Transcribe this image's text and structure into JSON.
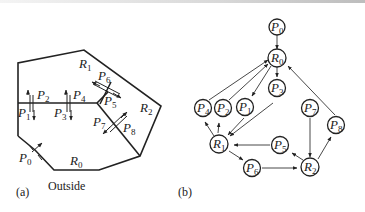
{
  "figure": {
    "panel_a": {
      "caption": "(a)",
      "outside_label": "Outside",
      "rooms": [
        {
          "id": "R0",
          "letter": "R",
          "sub": "0"
        },
        {
          "id": "R1",
          "letter": "R",
          "sub": "1"
        },
        {
          "id": "R2",
          "letter": "R",
          "sub": "2"
        }
      ],
      "doors": [
        {
          "id": "P0",
          "letter": "P",
          "sub": "0"
        },
        {
          "id": "P1",
          "letter": "P",
          "sub": "1"
        },
        {
          "id": "P2",
          "letter": "P",
          "sub": "2"
        },
        {
          "id": "P3",
          "letter": "P",
          "sub": "3"
        },
        {
          "id": "P4",
          "letter": "P",
          "sub": "4"
        },
        {
          "id": "P5",
          "letter": "P",
          "sub": "5"
        },
        {
          "id": "P6",
          "letter": "P",
          "sub": "6"
        },
        {
          "id": "P7",
          "letter": "P",
          "sub": "7"
        },
        {
          "id": "P8",
          "letter": "P",
          "sub": "8"
        }
      ]
    },
    "panel_b": {
      "caption": "(b)",
      "nodes": [
        {
          "id": "P0",
          "letter": "P",
          "sub": "0"
        },
        {
          "id": "R0",
          "letter": "R",
          "sub": "0"
        },
        {
          "id": "P3",
          "letter": "P",
          "sub": "3"
        },
        {
          "id": "P4",
          "letter": "P",
          "sub": "4"
        },
        {
          "id": "P2",
          "letter": "P",
          "sub": "2"
        },
        {
          "id": "P1",
          "letter": "P",
          "sub": "1"
        },
        {
          "id": "P7",
          "letter": "P",
          "sub": "7"
        },
        {
          "id": "P8",
          "letter": "P",
          "sub": "8"
        },
        {
          "id": "R1",
          "letter": "R",
          "sub": "1"
        },
        {
          "id": "P5",
          "letter": "P",
          "sub": "5"
        },
        {
          "id": "P6",
          "letter": "P",
          "sub": "6"
        },
        {
          "id": "R2",
          "letter": "R",
          "sub": "2"
        }
      ],
      "edges": [
        [
          "P0",
          "R0"
        ],
        [
          "R0",
          "P3"
        ],
        [
          "R0",
          "P1"
        ],
        [
          "P4",
          "R0"
        ],
        [
          "P2",
          "R0"
        ],
        [
          "P8",
          "R0"
        ],
        [
          "P3",
          "R1"
        ],
        [
          "P1",
          "R1"
        ],
        [
          "R1",
          "P4"
        ],
        [
          "R1",
          "P2"
        ],
        [
          "R1",
          "P6"
        ],
        [
          "P5",
          "R1"
        ],
        [
          "P6",
          "R2"
        ],
        [
          "P7",
          "R2"
        ],
        [
          "R2",
          "P5"
        ],
        [
          "R2",
          "P8"
        ]
      ]
    }
  }
}
